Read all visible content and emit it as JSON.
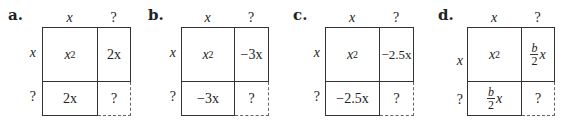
{
  "panels": [
    {
      "label": "a.",
      "col_headers": [
        "x",
        "?"
      ],
      "row_headers": [
        "x",
        "?"
      ],
      "cells": {
        "top_left_base": "x",
        "top_left_exp": "2",
        "top_right": "2x",
        "bottom_left": "2x",
        "bottom_right": "?"
      }
    },
    {
      "label": "b.",
      "col_headers": [
        "x",
        "?"
      ],
      "row_headers": [
        "x",
        "?"
      ],
      "cells": {
        "top_left_base": "x",
        "top_left_exp": "2",
        "top_right": "−3x",
        "bottom_left": "−3x",
        "bottom_right": "?"
      }
    },
    {
      "label": "c.",
      "col_headers": [
        "x",
        "?"
      ],
      "row_headers": [
        "x",
        "?"
      ],
      "cells": {
        "top_left_base": "x",
        "top_left_exp": "2",
        "top_right": "−2.5x",
        "bottom_left": "−2.5x",
        "bottom_right": "?"
      }
    },
    {
      "label": "d.",
      "col_headers": [
        "x",
        "?"
      ],
      "row_headers": [
        "x",
        "?"
      ],
      "cells": {
        "top_left_base": "x",
        "top_left_exp": "2",
        "top_right_num": "b",
        "top_right_den": "2",
        "top_right_var": "x",
        "bottom_left_num": "b",
        "bottom_left_den": "2",
        "bottom_left_var": "x",
        "bottom_right": "?"
      }
    }
  ]
}
